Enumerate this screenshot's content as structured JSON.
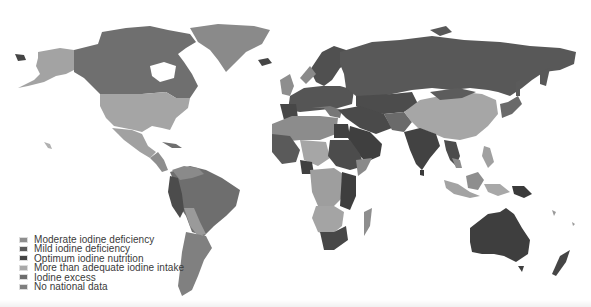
{
  "map": {
    "title": "",
    "type": "choropleth",
    "theme": "Iodine nutrition status by country",
    "colors": {
      "moderate_deficiency": "#8e8e8e",
      "mild_deficiency": "#5a5a5a",
      "optimum": "#464646",
      "more_than_adequate": "#a8a8a8",
      "excess": "#6e6e6e",
      "no_data": "#7e7e7e",
      "background": "#ffffff"
    }
  },
  "legend": {
    "items": [
      {
        "label": "Moderate iodine deficiency",
        "color": "#8e8e8e"
      },
      {
        "label": "Mild iodine deficiency",
        "color": "#5a5a5a"
      },
      {
        "label": "Optimum iodine nutrition",
        "color": "#454545"
      },
      {
        "label": "More than adequate iodine intake",
        "color": "#a9a9a9"
      },
      {
        "label": "Iodine excess",
        "color": "#6d6d6d"
      },
      {
        "label": "No national data",
        "color": "#7f7f7f"
      }
    ]
  }
}
